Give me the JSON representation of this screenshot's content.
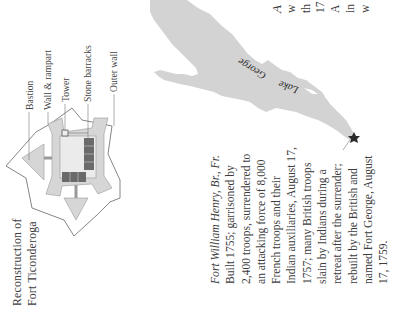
{
  "diagram": {
    "title_lines": [
      "Reconstruction of",
      "Fort Ticonderoga"
    ],
    "labels": {
      "bastion": "Bastion",
      "wall_rampart": "Wall & rampart",
      "tower": "Tower",
      "stone_barracks": "Stone barracks",
      "outer_wall": "Outer wall"
    }
  },
  "map": {
    "lake_label_word1": "Lake",
    "lake_label_word2": "George",
    "marker_icon": "star-icon"
  },
  "caption": {
    "title": "Fort William Henry, Br., Fr.",
    "lines": [
      "Built 1755; garrisoned by",
      "2,400 troops, surrendered to",
      "an attacking force of  8,000",
      "French troops and their",
      "Indian auxiliaries, August 17,",
      "1757; many British troops",
      "slain by Indians during a",
      "retreat after the surrender;",
      "rebuilt by the British and",
      "named Fort George, August",
      "17, 1759."
    ]
  },
  "side_text": {
    "lines": [
      "A",
      "w",
      "th",
      "17",
      "A",
      "in",
      "w"
    ]
  },
  "colors": {
    "lake": "#d3d3d3",
    "fort_fill": "#d6d6d6",
    "barracks": "#6a6a6a",
    "text": "#3d3d3d"
  }
}
